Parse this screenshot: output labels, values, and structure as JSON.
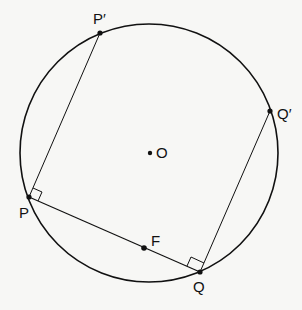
{
  "diagram": {
    "circle": {
      "cx": 149,
      "cy": 153,
      "r": 129
    },
    "points": {
      "P_prime": {
        "label": "P′",
        "x": 100,
        "y": 33
      },
      "P": {
        "label": "P",
        "x": 29,
        "y": 197
      },
      "Q": {
        "label": "Q",
        "x": 200,
        "y": 272
      },
      "Q_prime": {
        "label": "Q′",
        "x": 270,
        "y": 111
      },
      "O": {
        "label": "O",
        "x": 150,
        "y": 153
      },
      "F": {
        "label": "F",
        "x": 144,
        "y": 248
      }
    },
    "segments": [
      "P-P′",
      "P-Q",
      "Q-Q′"
    ],
    "right_angles": [
      "at P between PP′ and PQ",
      "at Q between QQ′ and QP"
    ],
    "colors": {
      "stroke": "#111111",
      "background": "#f7f7f5"
    }
  }
}
